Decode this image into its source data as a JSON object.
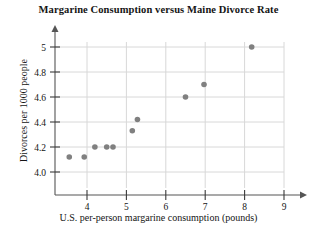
{
  "chart_data": {
    "type": "scatter",
    "title": "Margarine Consumption versus Maine Divorce Rate",
    "xlabel": "U.S. per-person margarine consumption (pounds)",
    "ylabel": "Divorces per 1000 people",
    "xlim": [
      3.0,
      9.4
    ],
    "ylim": [
      3.85,
      5.12
    ],
    "xticks": [
      4,
      5,
      6,
      7,
      8,
      9
    ],
    "xtick_labels": [
      "4",
      "5",
      "6",
      "7",
      "8",
      "9"
    ],
    "yticks": [
      4.0,
      4.2,
      4.4,
      4.6,
      4.8,
      5.0
    ],
    "ytick_labels": [
      "4.0",
      "4.2",
      "4.4",
      "4.6",
      "4.8",
      "5"
    ],
    "grid": true,
    "legend": "none",
    "marker_color": "#808080",
    "points": [
      {
        "x": 3.55,
        "y": 4.12
      },
      {
        "x": 3.93,
        "y": 4.12
      },
      {
        "x": 4.2,
        "y": 4.2
      },
      {
        "x": 4.5,
        "y": 4.2
      },
      {
        "x": 4.66,
        "y": 4.2
      },
      {
        "x": 5.15,
        "y": 4.33
      },
      {
        "x": 5.28,
        "y": 4.42
      },
      {
        "x": 6.5,
        "y": 4.6
      },
      {
        "x": 6.97,
        "y": 4.7
      },
      {
        "x": 8.18,
        "y": 5.0
      }
    ],
    "series_name": "Margarine vs Divorce Rate"
  }
}
